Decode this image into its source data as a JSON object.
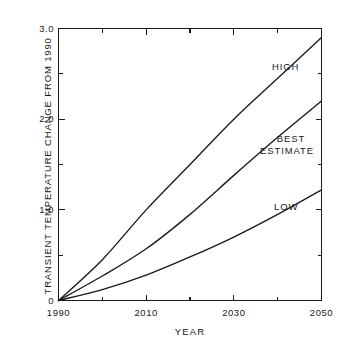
{
  "top_sliver_text": "",
  "chart_data": {
    "type": "line",
    "title": "",
    "xlabel": "YEAR",
    "ylabel": "TRANSIENT TEMPERATURE CHANGE FROM 1990",
    "xlim": [
      1990,
      2050
    ],
    "ylim": [
      0,
      3.0
    ],
    "grid": false,
    "legend_position": "inline-right",
    "x_ticks_major": [
      1990,
      2010,
      2030,
      2050
    ],
    "x_ticks_major_labels": [
      "1990",
      "2010",
      "2030",
      "2050"
    ],
    "x_ticks_minor": [
      2000,
      2020,
      2040
    ],
    "y_ticks_major": [
      0,
      1.0,
      2.0,
      3.0
    ],
    "y_ticks_major_labels": [
      "0",
      "1.0",
      "2.0",
      "3.0"
    ],
    "y_ticks_minor": [
      0.5,
      1.5,
      2.5
    ],
    "x": [
      1990,
      2000,
      2010,
      2020,
      2030,
      2040,
      2050
    ],
    "series": [
      {
        "name": "HIGH",
        "label": "HIGH",
        "values": [
          0.0,
          0.45,
          1.0,
          1.5,
          2.0,
          2.45,
          2.9
        ]
      },
      {
        "name": "BEST ESTIMATE",
        "label_line1": "BEST",
        "label_line2": "ESTIMATE",
        "values": [
          0.0,
          0.27,
          0.57,
          0.95,
          1.38,
          1.8,
          2.2
        ]
      },
      {
        "name": "LOW",
        "label": "LOW",
        "values": [
          0.0,
          0.12,
          0.28,
          0.48,
          0.7,
          0.95,
          1.22
        ]
      }
    ]
  }
}
